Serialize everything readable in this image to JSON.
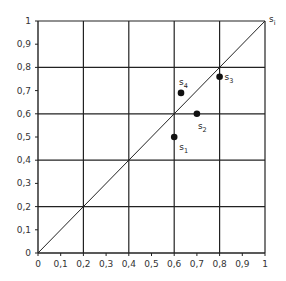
{
  "chart_data": {
    "type": "scatter",
    "title": "",
    "xlabel": "",
    "ylabel": "",
    "xlim": [
      0,
      1
    ],
    "ylim": [
      0,
      1
    ],
    "grid": true,
    "grid_step": 0.2,
    "x_ticks": [
      "0",
      "0,1",
      "0,2",
      "0,3",
      "0,4",
      "0,5",
      "0,6",
      "0,7",
      "0,8",
      "0,9",
      "1"
    ],
    "y_ticks": [
      "0",
      "0,1",
      "0,2",
      "0,3",
      "0,4",
      "0,5",
      "0,6",
      "0,7",
      "0,8",
      "0,9",
      "1"
    ],
    "diagonal": {
      "from": [
        0,
        0
      ],
      "to": [
        1,
        1
      ],
      "label": "s",
      "label_sub": "i"
    },
    "points": [
      {
        "label": "s",
        "sub": "1",
        "x": 0.6,
        "y": 0.5
      },
      {
        "label": "s",
        "sub": "2",
        "x": 0.7,
        "y": 0.6
      },
      {
        "label": "s",
        "sub": "3",
        "x": 0.8,
        "y": 0.76
      },
      {
        "label": "s",
        "sub": "4",
        "x": 0.63,
        "y": 0.69
      }
    ]
  }
}
